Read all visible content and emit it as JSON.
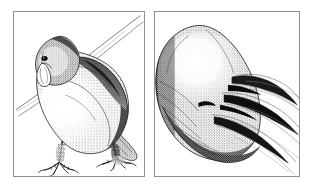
{
  "figure": {
    "kind": "stipple-line-illustration",
    "background_color": "#ffffff",
    "ink_color": "#121212",
    "frame_color": "#8d8f94",
    "panel_count": 2,
    "caption": "",
    "title": ""
  },
  "panels": [
    {
      "id": "panel-left",
      "label": "",
      "subject": "perched bird, head lowered, gripping a diagonal branch",
      "description": "Stippled drawing of a small parrot-like bird in left profile. The head is bowed with a short hooked beak pointing down at lower left. A dark shaded mantle runs over the shoulder and back. The tail sweeps down to the lower right. Two scaled, clawed feet grip a thin diagonal perch that rises from the lower right to the upper right corner.",
      "frame": {
        "x": 13,
        "y": 11,
        "width": 132,
        "height": 166
      },
      "elements": [
        {
          "name": "branch-perch",
          "note": "thin double line running diagonally from mid-left to upper right corner"
        },
        {
          "name": "bird-head",
          "note": "bowed head, upper left of panel"
        },
        {
          "name": "bird-beak",
          "note": "short hooked beak pointing down-left"
        },
        {
          "name": "bird-eye",
          "note": "small dark eye above beak"
        },
        {
          "name": "bird-mantle",
          "note": "dark stippled shoulder and back band"
        },
        {
          "name": "bird-breast",
          "note": "pale stippled breast"
        },
        {
          "name": "bird-tail",
          "note": "long tapering tail to lower right"
        },
        {
          "name": "bird-foot-front",
          "note": "clawed foot, lower left, gripping perch"
        },
        {
          "name": "bird-foot-rear",
          "note": "clawed foot, lower right, gripping perch"
        }
      ]
    },
    {
      "id": "panel-right",
      "label": "",
      "subject": "close-up detail of the bird's foot and claws",
      "description": "Enlarged stippled study of the bird's foot. A rounded pale toe pad fills the upper left. Several long curved claws fan out to the right, each drawn with a dark tapered tip and fine trailing outlines that run off the right edge of the frame. Dense stippling shades the underside of the foot at lower left.",
      "frame": {
        "x": 154,
        "y": 11,
        "width": 146,
        "height": 166
      },
      "elements": [
        {
          "name": "toe-pad",
          "note": "large rounded pale mass, upper left"
        },
        {
          "name": "claw-upper",
          "note": "uppermost curved claw with dark tip"
        },
        {
          "name": "claw-middle",
          "note": "central curved claw, darkest tip"
        },
        {
          "name": "claw-lower",
          "note": "lower curved claw trailing to right edge"
        },
        {
          "name": "foot-underside",
          "note": "heavily stippled shaded underside, lower left"
        },
        {
          "name": "scale-texture",
          "note": "fine striations across the toe"
        }
      ]
    }
  ]
}
